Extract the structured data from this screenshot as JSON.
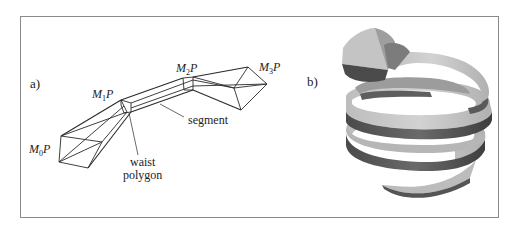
{
  "figure": {
    "panel_a": {
      "label": "a)",
      "nodes": [
        {
          "id": "M0",
          "label_main": "M",
          "label_sub": "0",
          "label_tail": "P"
        },
        {
          "id": "M1",
          "label_main": "M",
          "label_sub": "1",
          "label_tail": "P"
        },
        {
          "id": "M2",
          "label_main": "M",
          "label_sub": "2",
          "label_tail": "P"
        },
        {
          "id": "M3",
          "label_main": "M",
          "label_sub": "3",
          "label_tail": "P"
        }
      ],
      "annotations": {
        "segment": "segment",
        "waist_line1": "waist",
        "waist_line2": "polygon"
      }
    },
    "panel_b": {
      "label": "b)",
      "description": "shaded polygonal helix tube"
    },
    "colors": {
      "line": "#2a2a2a",
      "frame": "#8a8a8a",
      "helix_light": "#c9c9c9",
      "helix_mid": "#a6a6a6",
      "helix_dark": "#5a5a5a"
    }
  }
}
